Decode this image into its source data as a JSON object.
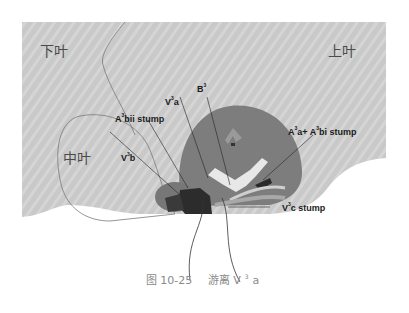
{
  "lobes": {
    "lower": "下叶",
    "upper": "上叶",
    "middle": "中叶"
  },
  "structures": {
    "v3a": {
      "base": "V",
      "sup": "3",
      "suffix": "a"
    },
    "b3": {
      "base": "B",
      "sup": "3",
      "suffix": ""
    },
    "a3bii": {
      "base": "A",
      "sup": "3",
      "suffix": "bii stump"
    },
    "a3a_a3bi": {
      "base1": "A",
      "sup1": "3",
      "mid": "a+ A",
      "sup2": "3",
      "suffix": "bi stump"
    },
    "v3b": {
      "base": "V",
      "sup": "3",
      "suffix": "b"
    },
    "v3c": {
      "base": "V",
      "sup": "3",
      "suffix": "c stump"
    }
  },
  "caption": {
    "figure_number": "图 10-25",
    "title_prefix": "游离 V",
    "title_sup": "3",
    "title_suffix": "a"
  },
  "colors": {
    "lung": "#c8c8c8",
    "lung_stripe": "#d6d6d6",
    "hilum": "#7a7a7a",
    "vessel_dark": "#2e2e2e",
    "bronchus": "#e6e6e6",
    "outline": "#6a6a6a",
    "caption": "#8a8a8a"
  }
}
